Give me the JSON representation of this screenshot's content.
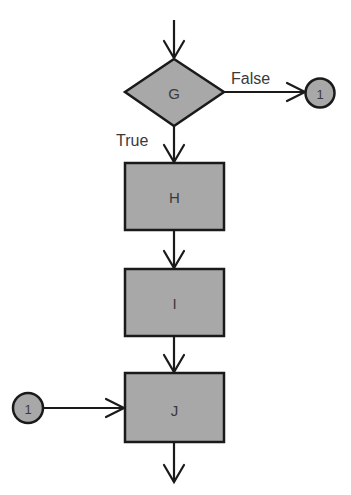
{
  "diagram": {
    "type": "flowchart",
    "colors": {
      "shape_fill": "#a8a8a8",
      "stroke": "#1a1a1a",
      "text": "#3a3a3a",
      "background": "#ffffff"
    },
    "nodes": {
      "G": {
        "shape": "diamond",
        "label": "G"
      },
      "H": {
        "shape": "rectangle",
        "label": "H"
      },
      "I": {
        "shape": "rectangle",
        "label": "I"
      },
      "J": {
        "shape": "rectangle",
        "label": "J"
      },
      "connector_out": {
        "shape": "circle",
        "label": "1"
      },
      "connector_in": {
        "shape": "circle",
        "label": "1"
      }
    },
    "branches": {
      "true_label": "True",
      "false_label": "False"
    },
    "edges": [
      {
        "from": "entry",
        "to": "G"
      },
      {
        "from": "G",
        "to": "connector_out",
        "label": "False"
      },
      {
        "from": "G",
        "to": "H",
        "label": "True"
      },
      {
        "from": "H",
        "to": "I"
      },
      {
        "from": "I",
        "to": "J"
      },
      {
        "from": "connector_in",
        "to": "J"
      },
      {
        "from": "J",
        "to": "exit"
      }
    ]
  }
}
